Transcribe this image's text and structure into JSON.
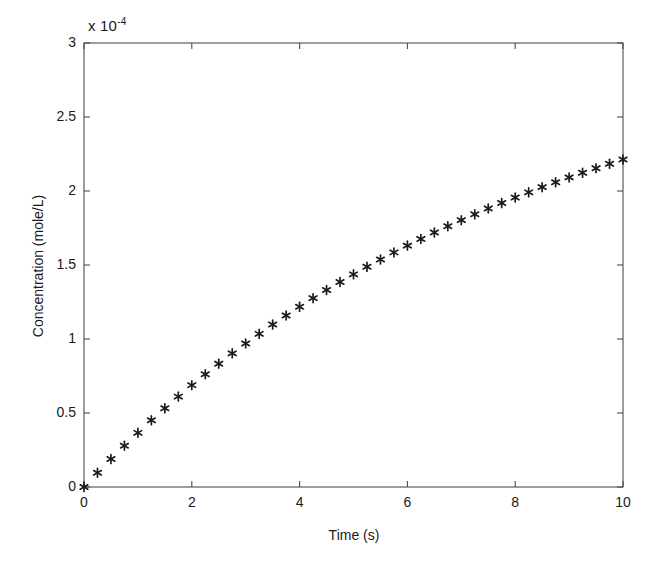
{
  "chart_data": {
    "type": "scatter",
    "title": "",
    "xlabel": "Time (s)",
    "ylabel": "Concentration (mole/L)",
    "y_exponent_label": "x 10",
    "y_exponent_power": "-4",
    "y_scale_factor": 0.0001,
    "xlim": [
      0,
      10
    ],
    "ylim": [
      0,
      3
    ],
    "xticks": [
      0,
      2,
      4,
      6,
      8,
      10
    ],
    "yticks": [
      0,
      0.5,
      1,
      1.5,
      2,
      2.5,
      3
    ],
    "xtick_labels": [
      "0",
      "2",
      "4",
      "6",
      "8",
      "10"
    ],
    "ytick_labels": [
      "0",
      "0.5",
      "1",
      "1.5",
      "2",
      "2.5",
      "3"
    ],
    "grid": false,
    "legend": false,
    "marker": "asterisk",
    "marker_color": "#1a1a1a",
    "axis_color": "#4d4d4d",
    "background_color": "#ffffff",
    "series": [
      {
        "name": "Concentration",
        "x": [
          0,
          0.25,
          0.5,
          0.75,
          1,
          1.25,
          1.5,
          1.75,
          2,
          2.25,
          2.5,
          2.75,
          3,
          3.25,
          3.5,
          3.75,
          4,
          4.25,
          4.5,
          4.75,
          5,
          5.25,
          5.5,
          5.75,
          6,
          6.25,
          6.5,
          6.75,
          7,
          7.25,
          7.5,
          7.75,
          8,
          8.25,
          8.5,
          8.75,
          9,
          9.25,
          9.5,
          9.75,
          10
        ],
        "y": [
          0.0,
          0.096,
          0.189,
          0.279,
          0.366,
          0.451,
          0.532,
          0.611,
          0.688,
          0.762,
          0.833,
          0.903,
          0.97,
          1.035,
          1.098,
          1.159,
          1.218,
          1.276,
          1.331,
          1.385,
          1.437,
          1.488,
          1.537,
          1.585,
          1.631,
          1.676,
          1.72,
          1.762,
          1.803,
          1.843,
          1.882,
          1.919,
          1.956,
          1.991,
          2.026,
          2.059,
          2.092,
          2.123,
          2.154,
          2.184,
          2.213
        ]
      }
    ]
  }
}
